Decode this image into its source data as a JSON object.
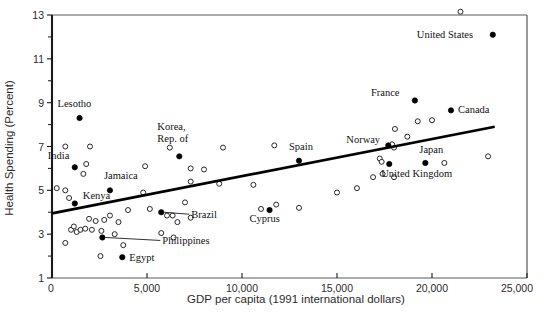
{
  "chart_data": {
    "type": "scatter",
    "title": "",
    "xlabel": "GDP per capita (1991 international dollars)",
    "ylabel": "Health Spending (Percent)",
    "xlim": [
      0,
      25000
    ],
    "ylim": [
      1,
      13
    ],
    "xticks": [
      0,
      5000,
      10000,
      15000,
      20000,
      25000
    ],
    "xticklabels": [
      "0",
      "5,000",
      "10,000",
      "15,000",
      "20,000",
      "25,000"
    ],
    "yticks": [
      1,
      3,
      5,
      7,
      9,
      11,
      13
    ],
    "yticklabels": [
      "1",
      "3",
      "5",
      "7",
      "9",
      "11",
      "13"
    ],
    "yticks_minor": [
      2,
      4,
      6,
      8,
      10,
      12
    ],
    "grid": false,
    "legend": "none",
    "trendline": {
      "type": "line",
      "x": [
        0,
        23300
      ],
      "y": [
        3.95,
        7.9
      ],
      "color": "#000000"
    },
    "series": [
      {
        "name": "Labeled countries",
        "marker": "filled-circle",
        "color": "#000000",
        "points": [
          {
            "label": "Lesotho",
            "x": 1450,
            "y": 8.3,
            "label_dx": -22,
            "label_dy": -11
          },
          {
            "label": "India",
            "x": 1200,
            "y": 6.05,
            "label_dx": -27,
            "label_dy": -8
          },
          {
            "label": "Kenya",
            "x": 1200,
            "y": 4.4,
            "label_dx": 8,
            "label_dy": -4
          },
          {
            "label": "Jamaica",
            "x": 3050,
            "y": 5.0,
            "label_dx": -6,
            "label_dy": -11
          },
          {
            "label": "Egypt",
            "x": 3700,
            "y": 1.95,
            "label_dx": 7,
            "label_dy": 4
          },
          {
            "label": "Philippines",
            "x": 2650,
            "y": 2.85,
            "label_dx": 0,
            "label_dy": 0
          },
          {
            "label": "Brazil",
            "x": 5750,
            "y": 4.0,
            "label_dx": 0,
            "label_dy": 0
          },
          {
            "label": "Korea, Rep. of",
            "x": 6700,
            "y": 6.55,
            "label_dx": -22,
            "label_dy": -26
          },
          {
            "label": "Cyprus",
            "x": 11450,
            "y": 4.1,
            "label_dx": -20,
            "label_dy": 12
          },
          {
            "label": "Spain",
            "x": 13000,
            "y": 6.35,
            "label_dx": -10,
            "label_dy": -11
          },
          {
            "label": "Norway",
            "x": 17700,
            "y": 7.05,
            "label_dx": -42,
            "label_dy": -2
          },
          {
            "label": "United Kingdom",
            "x": 17750,
            "y": 6.2,
            "label_dx": -8,
            "label_dy": 13
          },
          {
            "label": "Japan",
            "x": 19650,
            "y": 6.25,
            "label_dx": -6,
            "label_dy": -10
          },
          {
            "label": "France",
            "x": 19100,
            "y": 9.1,
            "label_dx": -44,
            "label_dy": -4
          },
          {
            "label": "Canada",
            "x": 21000,
            "y": 8.65,
            "label_dx": 7,
            "label_dy": 3
          },
          {
            "label": "United States",
            "x": 23200,
            "y": 12.1,
            "label_dx": -76,
            "label_dy": 3
          }
        ]
      },
      {
        "name": "Unlabeled countries",
        "marker": "open-circle",
        "color": "#111111",
        "points": [
          {
            "x": 700,
            "y": 7.0
          },
          {
            "x": 2000,
            "y": 7.0
          },
          {
            "x": 6200,
            "y": 6.95
          },
          {
            "x": 9000,
            "y": 6.95
          },
          {
            "x": 11700,
            "y": 7.05
          },
          {
            "x": 1800,
            "y": 6.2
          },
          {
            "x": 4900,
            "y": 6.1
          },
          {
            "x": 7300,
            "y": 6.0
          },
          {
            "x": 8000,
            "y": 5.95
          },
          {
            "x": 1650,
            "y": 5.75
          },
          {
            "x": 250,
            "y": 5.1
          },
          {
            "x": 700,
            "y": 5.0
          },
          {
            "x": 7300,
            "y": 5.4
          },
          {
            "x": 8800,
            "y": 5.3
          },
          {
            "x": 10600,
            "y": 5.25
          },
          {
            "x": 900,
            "y": 4.65
          },
          {
            "x": 4800,
            "y": 4.9
          },
          {
            "x": 7000,
            "y": 4.45
          },
          {
            "x": 15000,
            "y": 4.9
          },
          {
            "x": 4000,
            "y": 4.1
          },
          {
            "x": 5150,
            "y": 4.15
          },
          {
            "x": 1950,
            "y": 3.7
          },
          {
            "x": 2300,
            "y": 3.6
          },
          {
            "x": 2750,
            "y": 3.65
          },
          {
            "x": 3050,
            "y": 3.85
          },
          {
            "x": 3500,
            "y": 3.55
          },
          {
            "x": 6050,
            "y": 3.85
          },
          {
            "x": 6350,
            "y": 3.85
          },
          {
            "x": 7300,
            "y": 3.75
          },
          {
            "x": 6600,
            "y": 3.55
          },
          {
            "x": 11000,
            "y": 4.15
          },
          {
            "x": 13000,
            "y": 4.2
          },
          {
            "x": 1000,
            "y": 3.2
          },
          {
            "x": 1150,
            "y": 3.35
          },
          {
            "x": 1300,
            "y": 3.1
          },
          {
            "x": 1500,
            "y": 3.2
          },
          {
            "x": 1750,
            "y": 3.25
          },
          {
            "x": 2100,
            "y": 3.2
          },
          {
            "x": 2600,
            "y": 3.15
          },
          {
            "x": 3300,
            "y": 3.0
          },
          {
            "x": 5750,
            "y": 3.05
          },
          {
            "x": 700,
            "y": 2.6
          },
          {
            "x": 3750,
            "y": 2.5
          },
          {
            "x": 6400,
            "y": 2.85
          },
          {
            "x": 2550,
            "y": 2.0
          },
          {
            "x": 16050,
            "y": 5.1
          },
          {
            "x": 17400,
            "y": 5.75
          },
          {
            "x": 18000,
            "y": 5.6
          },
          {
            "x": 17250,
            "y": 6.45
          },
          {
            "x": 17350,
            "y": 6.3
          },
          {
            "x": 18000,
            "y": 6.95
          },
          {
            "x": 17900,
            "y": 7.1
          },
          {
            "x": 18700,
            "y": 7.45
          },
          {
            "x": 18050,
            "y": 7.8
          },
          {
            "x": 19250,
            "y": 8.15
          },
          {
            "x": 20000,
            "y": 8.2
          },
          {
            "x": 16900,
            "y": 5.6
          },
          {
            "x": 20650,
            "y": 6.25
          },
          {
            "x": 22950,
            "y": 6.55
          },
          {
            "x": 11800,
            "y": 4.35
          },
          {
            "x": 21500,
            "y": 13.15
          }
        ]
      }
    ]
  },
  "labels": {
    "korea_line1": "Korea,",
    "korea_line2": "Rep. of"
  }
}
